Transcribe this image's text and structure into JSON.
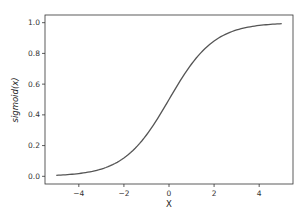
{
  "chart_data": {
    "type": "line",
    "title": "",
    "xlabel": "X",
    "ylabel": "sigmoid(x)",
    "xlim": [
      -5.5,
      5.5
    ],
    "ylim": [
      -0.05,
      1.05
    ],
    "xticks": [
      "-4",
      "-2",
      "0",
      "2",
      "4"
    ],
    "yticks": [
      "0.0",
      "0.2",
      "0.4",
      "0.6",
      "0.8",
      "1.0"
    ],
    "grid": false,
    "legend": null,
    "series": [
      {
        "name": "sigmoid(x)",
        "color": "#555555",
        "x": [
          -5,
          -4,
          -3,
          -2,
          -1,
          0,
          1,
          2,
          3,
          4,
          5
        ],
        "y": [
          0.007,
          0.018,
          0.047,
          0.119,
          0.269,
          0.5,
          0.731,
          0.881,
          0.953,
          0.982,
          0.993
        ]
      }
    ]
  }
}
